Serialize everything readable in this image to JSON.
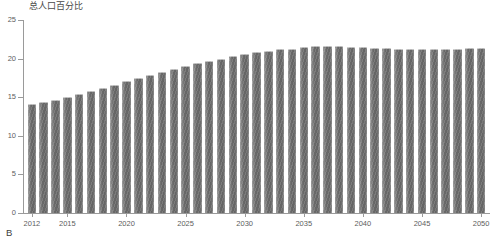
{
  "panel": {
    "label": "B"
  },
  "chart_data": {
    "type": "bar",
    "title": "总人口百分比",
    "subtitle": "",
    "xlabel": "",
    "ylabel": "",
    "ylim": [
      0,
      25
    ],
    "yticks": [
      0,
      5,
      10,
      15,
      20,
      25
    ],
    "xtick_labels": [
      "2012",
      "2015",
      "2020",
      "2025",
      "2030",
      "2035",
      "2040",
      "2045",
      "2050"
    ],
    "grid": false,
    "legend": null,
    "bar_color": "#6e6e6e",
    "axis_color": "#9a9a9a",
    "categories": [
      "2012",
      "2013",
      "2014",
      "2015",
      "2016",
      "2017",
      "2018",
      "2019",
      "2020",
      "2021",
      "2022",
      "2023",
      "2024",
      "2025",
      "2026",
      "2027",
      "2028",
      "2029",
      "2030",
      "2031",
      "2032",
      "2033",
      "2034",
      "2035",
      "2036",
      "2037",
      "2038",
      "2039",
      "2040",
      "2041",
      "2042",
      "2043",
      "2044",
      "2045",
      "2046",
      "2047",
      "2048",
      "2049",
      "2050"
    ],
    "values": [
      14.1,
      14.4,
      14.6,
      15.0,
      15.4,
      15.8,
      16.2,
      16.6,
      17.1,
      17.5,
      17.9,
      18.3,
      18.7,
      19.1,
      19.4,
      19.7,
      20.0,
      20.3,
      20.6,
      20.8,
      21.0,
      21.2,
      21.3,
      21.5,
      21.6,
      21.6,
      21.6,
      21.5,
      21.5,
      21.4,
      21.4,
      21.3,
      21.3,
      21.3,
      21.3,
      21.3,
      21.3,
      21.4,
      21.4
    ]
  }
}
